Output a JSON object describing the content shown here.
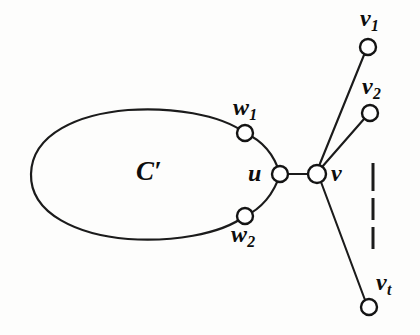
{
  "figure": {
    "background_color": "#fdfdfc",
    "stroke_color": "#1b1b1b",
    "node_fill_color": "#ffffff"
  },
  "labels": {
    "cycle": {
      "base": "C",
      "prime": "′"
    },
    "u": {
      "base": "u",
      "sub": ""
    },
    "v": {
      "base": "v",
      "sub": ""
    },
    "v1": {
      "base": "v",
      "sub": "1"
    },
    "v2": {
      "base": "v",
      "sub": "2"
    },
    "vt": {
      "base": "v",
      "sub": "t"
    },
    "w1": {
      "base": "w",
      "sub": "1"
    },
    "w2": {
      "base": "w",
      "sub": "2"
    }
  },
  "graph": {
    "type": "diagram",
    "nodes": [
      {
        "id": "w1",
        "label": "w1",
        "x": 245,
        "y": 133,
        "r": 8
      },
      {
        "id": "u",
        "label": "u",
        "x": 280,
        "y": 174,
        "r": 8
      },
      {
        "id": "w2",
        "label": "w2",
        "x": 245,
        "y": 216,
        "r": 8
      },
      {
        "id": "v",
        "label": "v",
        "x": 317,
        "y": 174,
        "r": 9
      },
      {
        "id": "v1",
        "label": "v1",
        "x": 368,
        "y": 47,
        "r": 8
      },
      {
        "id": "v2",
        "label": "v2",
        "x": 370,
        "y": 113,
        "r": 8
      },
      {
        "id": "vt",
        "label": "vt",
        "x": 369,
        "y": 307,
        "r": 8
      }
    ],
    "edges": [
      {
        "from": "u",
        "to": "v",
        "style": "straight"
      },
      {
        "from": "v",
        "to": "v1",
        "style": "straight"
      },
      {
        "from": "v",
        "to": "v2",
        "style": "straight"
      },
      {
        "from": "v",
        "to": "vt",
        "style": "straight"
      },
      {
        "from": "w1",
        "to": "u",
        "style": "curved"
      },
      {
        "from": "u",
        "to": "w2",
        "style": "curved"
      },
      {
        "from": "w1",
        "to": "w2",
        "style": "ellipse-arc"
      }
    ],
    "ellipsis": {
      "orientation": "vertical",
      "x": 373,
      "y_start": 163,
      "y_end": 248,
      "dash_count": 3,
      "meaning": "remaining pendant vertices between v2 and vt"
    }
  }
}
